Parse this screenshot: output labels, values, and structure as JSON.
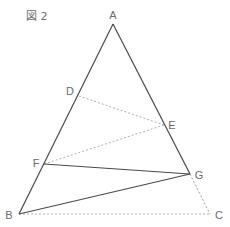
{
  "figure": {
    "label": "図 2"
  },
  "points": {
    "A": {
      "label": "A",
      "x": 113,
      "y": 24,
      "lx": 113,
      "ly": 19
    },
    "B": {
      "label": "B",
      "x": 19,
      "y": 214,
      "lx": 9,
      "ly": 219
    },
    "C": {
      "label": "C",
      "x": 210,
      "y": 214,
      "lx": 219,
      "ly": 219
    },
    "D": {
      "label": "D",
      "x": 79,
      "y": 96,
      "lx": 70,
      "ly": 95
    },
    "E": {
      "label": "E",
      "x": 164,
      "y": 125,
      "lx": 172,
      "ly": 129
    },
    "F": {
      "label": "F",
      "x": 44,
      "y": 164,
      "lx": 36,
      "ly": 167
    },
    "G": {
      "label": "G",
      "x": 190,
      "y": 174,
      "lx": 199,
      "ly": 179
    }
  },
  "segments": {
    "solid": [
      [
        "A",
        "B"
      ],
      [
        "A",
        "G"
      ],
      [
        "F",
        "G"
      ],
      [
        "B",
        "G"
      ]
    ],
    "dashed": [
      [
        "D",
        "E"
      ],
      [
        "E",
        "F"
      ],
      [
        "G",
        "C"
      ],
      [
        "B",
        "C"
      ]
    ],
    "faint_dashed": [
      [
        "A",
        "C"
      ]
    ]
  },
  "colors": {
    "solid": "#4a4a4a",
    "dashed": "#9a9a9a",
    "faint": "#e6e6e6",
    "label": "#6a6a6a"
  }
}
